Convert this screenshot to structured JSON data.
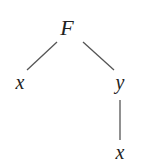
{
  "diagram": {
    "type": "tree",
    "nodes": [
      {
        "id": "root",
        "label": "F",
        "x": 67,
        "y": 28,
        "size": 22
      },
      {
        "id": "left",
        "label": "x",
        "x": 20,
        "y": 82,
        "size": 20
      },
      {
        "id": "right",
        "label": "y",
        "x": 120,
        "y": 82,
        "size": 20
      },
      {
        "id": "right-child",
        "label": "x",
        "x": 120,
        "y": 152,
        "size": 20
      }
    ],
    "edges": [
      {
        "from": "root",
        "to": "left",
        "x1": 57,
        "y1": 42,
        "x2": 27,
        "y2": 70
      },
      {
        "from": "root",
        "to": "right",
        "x1": 83,
        "y1": 42,
        "x2": 114,
        "y2": 70
      },
      {
        "from": "right",
        "to": "right-child",
        "x1": 120,
        "y1": 100,
        "x2": 120,
        "y2": 140
      }
    ],
    "line_color": "#555555",
    "text_color": "#222222"
  }
}
